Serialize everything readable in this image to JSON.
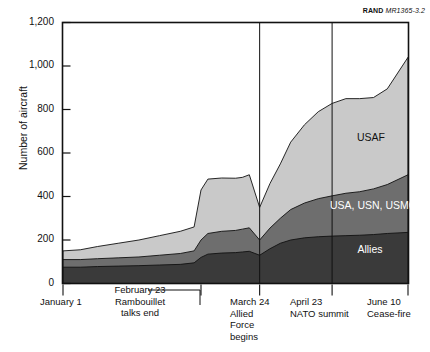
{
  "credit": {
    "org": "RAND",
    "doc_id": "MR1365-3.2"
  },
  "chart_data": {
    "type": "area",
    "stacked": true,
    "title": "",
    "xlabel": "",
    "ylabel": "Number of aircraft",
    "ylim": [
      0,
      1200
    ],
    "yticks": [
      0,
      200,
      400,
      600,
      800,
      1000,
      1200
    ],
    "ytick_labels": [
      "0",
      "200",
      "400",
      "600",
      "800",
      "1,000",
      "1,200"
    ],
    "grid": false,
    "legend_position": "in-plot",
    "xlim": [
      0,
      100
    ],
    "x": [
      0,
      5,
      10,
      16,
      22,
      28,
      34,
      38,
      40,
      42,
      46,
      50,
      52,
      54,
      57,
      60,
      63,
      66,
      70,
      74,
      78,
      82,
      86,
      90,
      94,
      100
    ],
    "series": [
      {
        "name": "Allies",
        "color": "#3a3a3a",
        "values": [
          75,
          75,
          78,
          80,
          82,
          85,
          88,
          95,
          120,
          135,
          140,
          142,
          145,
          148,
          130,
          160,
          185,
          200,
          210,
          215,
          218,
          220,
          222,
          225,
          230,
          235
        ]
      },
      {
        "name": "USA, USN, USMC",
        "color": "#6e6e6e",
        "values": [
          35,
          35,
          36,
          38,
          40,
          45,
          50,
          55,
          80,
          95,
          100,
          102,
          105,
          108,
          70,
          95,
          115,
          140,
          160,
          175,
          185,
          195,
          200,
          210,
          225,
          265
        ]
      },
      {
        "name": "USAF",
        "color": "#c9c9c9",
        "values": [
          40,
          45,
          56,
          67,
          78,
          90,
          102,
          110,
          230,
          250,
          245,
          240,
          238,
          244,
          150,
          205,
          250,
          310,
          360,
          400,
          425,
          435,
          428,
          420,
          440,
          540
        ]
      }
    ],
    "annotations": [
      {
        "name": "january-1",
        "x": 0,
        "lines": [
          "January 1"
        ],
        "leader": false
      },
      {
        "name": "february-23",
        "x": 40,
        "lines": [
          "February 23",
          "Rambouillet",
          "talks end"
        ],
        "leader": true
      },
      {
        "name": "march-24",
        "x": 57,
        "lines": [
          "March 24",
          "Allied",
          "Force",
          "begins"
        ],
        "leader": false
      },
      {
        "name": "april-23",
        "x": 78,
        "lines": [
          "April 23",
          "NATO summit"
        ],
        "leader": false
      },
      {
        "name": "june-10",
        "x": 100,
        "lines": [
          "June 10",
          "Cease-fire"
        ],
        "leader": false
      }
    ],
    "event_lines": [
      57,
      78
    ],
    "series_labels": [
      {
        "name": "USAF",
        "text": "USAF"
      },
      {
        "name": "usa-usn-usmc",
        "text": "USA, USN,\nUSMC"
      },
      {
        "name": "allies",
        "text": "Allies"
      }
    ]
  }
}
